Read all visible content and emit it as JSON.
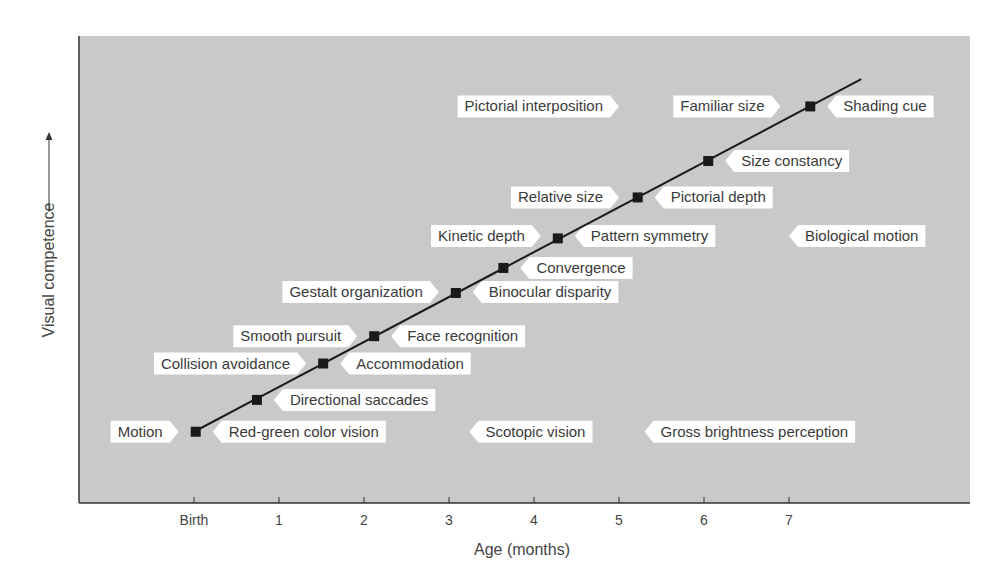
{
  "chart_data": {
    "type": "line",
    "title": "",
    "xlabel": "Age (months)",
    "ylabel": "Visual competence",
    "xlim": [
      -1.4,
      9.1
    ],
    "ylim": [
      0,
      1
    ],
    "grid": false,
    "x_ticks": [
      {
        "value": 0,
        "label": "Birth"
      },
      {
        "value": 1,
        "label": "1"
      },
      {
        "value": 2,
        "label": "2"
      },
      {
        "value": 3,
        "label": "3"
      },
      {
        "value": 4,
        "label": "4"
      },
      {
        "value": 5,
        "label": "5"
      },
      {
        "value": 6,
        "label": "6"
      },
      {
        "value": 7,
        "label": "7"
      }
    ],
    "trend_line": {
      "x": [
        0.0,
        7.85
      ],
      "y": [
        0.15,
        0.925
      ]
    },
    "markers": [
      {
        "x": 0.02,
        "y": 0.15
      },
      {
        "x": 0.74,
        "y": 0.22
      },
      {
        "x": 1.52,
        "y": 0.3
      },
      {
        "x": 2.12,
        "y": 0.36
      },
      {
        "x": 3.08,
        "y": 0.455
      },
      {
        "x": 3.64,
        "y": 0.51
      },
      {
        "x": 4.28,
        "y": 0.575
      },
      {
        "x": 5.22,
        "y": 0.665
      },
      {
        "x": 6.05,
        "y": 0.745
      },
      {
        "x": 7.25,
        "y": 0.865
      }
    ],
    "annotations": [
      {
        "text": "Pictorial interposition",
        "x": 5.0,
        "y": 0.865,
        "side": "left"
      },
      {
        "text": "Familiar size",
        "x": 6.9,
        "y": 0.865,
        "side": "left"
      },
      {
        "text": "Shading cue",
        "x": 7.45,
        "y": 0.865,
        "side": "right"
      },
      {
        "text": "Size constancy",
        "x": 6.25,
        "y": 0.745,
        "side": "right"
      },
      {
        "text": "Relative size",
        "x": 5.0,
        "y": 0.665,
        "side": "left"
      },
      {
        "text": "Pictorial depth",
        "x": 5.42,
        "y": 0.665,
        "side": "right"
      },
      {
        "text": "Kinetic depth",
        "x": 4.08,
        "y": 0.58,
        "side": "left"
      },
      {
        "text": "Pattern symmetry",
        "x": 4.48,
        "y": 0.58,
        "side": "right"
      },
      {
        "text": "Biological motion",
        "x": 7.0,
        "y": 0.58,
        "side": "right"
      },
      {
        "text": "Convergence",
        "x": 3.84,
        "y": 0.51,
        "side": "right"
      },
      {
        "text": "Gestalt organization",
        "x": 2.88,
        "y": 0.457,
        "side": "left"
      },
      {
        "text": "Binocular disparity",
        "x": 3.28,
        "y": 0.457,
        "side": "right"
      },
      {
        "text": "Smooth pursuit",
        "x": 1.92,
        "y": 0.36,
        "side": "left"
      },
      {
        "text": "Face recognition",
        "x": 2.32,
        "y": 0.36,
        "side": "right"
      },
      {
        "text": "Collision avoidance",
        "x": 1.32,
        "y": 0.3,
        "side": "left"
      },
      {
        "text": "Accommodation",
        "x": 1.72,
        "y": 0.3,
        "side": "right"
      },
      {
        "text": "Directional saccades",
        "x": 0.94,
        "y": 0.22,
        "side": "right"
      },
      {
        "text": "Motion",
        "x": -0.18,
        "y": 0.15,
        "side": "left"
      },
      {
        "text": "Red-green color vision",
        "x": 0.22,
        "y": 0.15,
        "side": "right"
      },
      {
        "text": "Scotopic vision",
        "x": 3.24,
        "y": 0.15,
        "side": "right"
      },
      {
        "text": "Gross brightness perception",
        "x": 5.3,
        "y": 0.15,
        "side": "right"
      }
    ]
  },
  "colors": {
    "plot_background": "#c9c9c9",
    "label_background": "#ffffff",
    "line": "#1a1a1a",
    "marker": "#1a1a1a",
    "text": "#3a3a3a"
  }
}
